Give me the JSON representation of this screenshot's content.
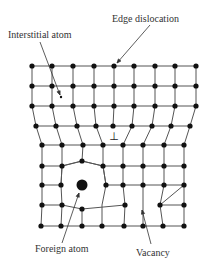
{
  "figure": {
    "type": "crystal-lattice-defects-diagram",
    "labels": {
      "interstitial_atom": "Interstitial atom",
      "edge_dislocation": "Edge dislocation",
      "foreign_atom": "Foreign atom",
      "vacancy": "Vacancy"
    },
    "dislocation_symbol": "⊥",
    "colors": {
      "atom": "#111111",
      "bond": "#555555",
      "text": "#333333",
      "background": "#ffffff"
    }
  },
  "lattice": {
    "rows": [
      [
        [
          32,
          66
        ],
        [
          52,
          66
        ],
        [
          73,
          66
        ],
        [
          94,
          66
        ],
        [
          114,
          66
        ],
        [
          134,
          66
        ],
        [
          155,
          66
        ],
        [
          175,
          66
        ],
        [
          196,
          66
        ]
      ],
      [
        [
          32,
          86
        ],
        [
          52,
          86
        ],
        [
          73,
          86
        ],
        [
          94,
          86
        ],
        [
          114,
          86
        ],
        [
          134,
          86
        ],
        [
          155,
          86
        ],
        [
          175,
          86
        ],
        [
          196,
          86
        ]
      ],
      [
        [
          32,
          106
        ],
        [
          52,
          106
        ],
        [
          73,
          106
        ],
        [
          94,
          106
        ],
        [
          114,
          106
        ],
        [
          134,
          106
        ],
        [
          155,
          106
        ],
        [
          175,
          106
        ],
        [
          196,
          106
        ]
      ],
      [
        [
          36,
          126
        ],
        [
          56,
          126
        ],
        [
          77,
          126
        ],
        [
          96,
          126
        ],
        [
          113,
          126
        ],
        [
          132,
          126
        ],
        [
          152,
          126
        ],
        [
          171,
          126
        ],
        [
          190,
          126
        ]
      ],
      [
        [
          42,
          145
        ],
        [
          62,
          145
        ],
        [
          83,
          145
        ],
        [
          103,
          145
        ],
        [
          123,
          145
        ],
        [
          143,
          145
        ],
        [
          164,
          145
        ],
        [
          184,
          145
        ]
      ],
      [
        [
          42,
          166
        ],
        [
          62,
          166
        ],
        [
          82,
          161
        ],
        [
          103,
          166
        ],
        [
          123,
          166
        ],
        [
          143,
          166
        ],
        [
          164,
          166
        ],
        [
          184,
          166
        ]
      ],
      [
        [
          42,
          185
        ],
        [
          61,
          185
        ],
        [
          106,
          185
        ],
        [
          123,
          185
        ],
        [
          143,
          185
        ],
        [
          164,
          185
        ],
        [
          184,
          185
        ]
      ],
      [
        [
          42,
          205
        ],
        [
          62,
          205
        ],
        [
          82,
          209
        ],
        [
          125,
          205
        ],
        [
          160,
          205
        ],
        [
          184,
          205
        ]
      ],
      [
        [
          41,
          226
        ],
        [
          61,
          226
        ],
        [
          82,
          226
        ],
        [
          102,
          226
        ],
        [
          124,
          226
        ],
        [
          143,
          226
        ],
        [
          163,
          226
        ],
        [
          184,
          226
        ]
      ]
    ],
    "foreign_atom": [
      82,
      185
    ],
    "interstitial_atom": [
      61,
      97
    ],
    "dislocation_symbol_pos": [
      114,
      136
    ],
    "vacancy_site": [
      143,
      205
    ]
  }
}
